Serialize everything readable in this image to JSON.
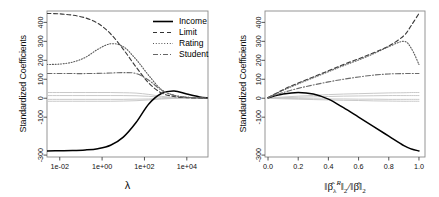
{
  "figure": {
    "title": "",
    "background": "#ffffff",
    "panel_count": 2
  },
  "legend": {
    "position": "top-right of left panel",
    "entries": [
      {
        "label": "Income",
        "style": "solid",
        "color": "#000000"
      },
      {
        "label": "Limit",
        "style": "dashed",
        "color": "#444444"
      },
      {
        "label": "Rating",
        "style": "dotted",
        "color": "#666666"
      },
      {
        "label": "Student",
        "style": "dash-dot",
        "color": "#777777"
      }
    ]
  },
  "chart_data": [
    {
      "type": "line",
      "panel": "left",
      "title": "",
      "xlabel": "λ",
      "ylabel": "Standardized Coefficients",
      "xscale": "log",
      "xlim": [
        0.0025,
        100000
      ],
      "ylim": [
        -310,
        460
      ],
      "xticks": [
        0.01,
        1,
        100,
        10000
      ],
      "xticklabels": [
        "1e-02",
        "1e+00",
        "1e+02",
        "1e+04"
      ],
      "yticks": [
        -300,
        -100,
        0,
        100,
        200,
        300,
        400
      ],
      "yticklabels": [
        "-300",
        "-100",
        "0",
        "100",
        "200",
        "300",
        "400"
      ],
      "grid": false,
      "x": [
        0.0025,
        0.01,
        0.04,
        0.16,
        0.63,
        2.5,
        10,
        40,
        160,
        630,
        2500,
        10000,
        40000,
        100000
      ],
      "series": [
        {
          "name": "Income",
          "style": "solid",
          "values": [
            -278,
            -277,
            -276,
            -273,
            -266,
            -248,
            -205,
            -128,
            -30,
            25,
            38,
            22,
            7,
            2
          ]
        },
        {
          "name": "Limit",
          "style": "dashed",
          "values": [
            447,
            445,
            438,
            424,
            395,
            340,
            258,
            165,
            80,
            28,
            9,
            3,
            1,
            0
          ]
        },
        {
          "name": "Rating",
          "style": "dotted",
          "values": [
            178,
            180,
            190,
            215,
            258,
            287,
            272,
            205,
            120,
            46,
            16,
            5,
            2,
            1
          ]
        },
        {
          "name": "Student",
          "style": "dash-dot",
          "values": [
            130,
            130,
            130,
            130,
            131,
            133,
            135,
            130,
            95,
            42,
            15,
            5,
            2,
            1
          ]
        },
        {
          "name": "other-1",
          "style": "faint",
          "values": [
            30,
            30,
            30,
            30,
            30,
            30,
            29,
            27,
            20,
            10,
            4,
            1,
            0,
            0
          ]
        },
        {
          "name": "other-2",
          "style": "faint",
          "values": [
            14,
            14,
            14,
            14,
            14,
            14,
            14,
            13,
            10,
            5,
            2,
            1,
            0,
            0
          ]
        },
        {
          "name": "other-3",
          "style": "faint",
          "values": [
            -6,
            -6,
            -6,
            -6,
            -6,
            -6,
            -6,
            -5,
            -4,
            -2,
            -1,
            0,
            0,
            0
          ]
        },
        {
          "name": "other-4",
          "style": "faint",
          "values": [
            -16,
            -16,
            -16,
            -16,
            -16,
            -16,
            -15,
            -13,
            -9,
            -4,
            -1,
            0,
            0,
            0
          ]
        }
      ]
    },
    {
      "type": "line",
      "panel": "right",
      "title": "",
      "xlabel": "||β̂λᴿ||₂ / ||β̂||₂",
      "ylabel": "Standardized Coefficients",
      "xscale": "linear",
      "xlim": [
        -0.02,
        1.04
      ],
      "ylim": [
        -310,
        460
      ],
      "xticks": [
        0.0,
        0.2,
        0.4,
        0.6,
        0.8,
        1.0
      ],
      "xticklabels": [
        "0.0",
        "0.2",
        "0.4",
        "0.6",
        "0.8",
        "1.0"
      ],
      "yticks": [
        -300,
        -100,
        0,
        100,
        200,
        300,
        400
      ],
      "yticklabels": [
        "-300",
        "-100",
        "0",
        "100",
        "200",
        "300",
        "400"
      ],
      "grid": false,
      "x": [
        0.0,
        0.1,
        0.2,
        0.3,
        0.4,
        0.5,
        0.6,
        0.7,
        0.8,
        0.9,
        0.95,
        1.0
      ],
      "series": [
        {
          "name": "Income",
          "style": "solid",
          "values": [
            3,
            22,
            30,
            22,
            -5,
            -50,
            -100,
            -150,
            -200,
            -250,
            -268,
            -278
          ]
        },
        {
          "name": "Limit",
          "style": "dashed",
          "values": [
            3,
            45,
            80,
            112,
            145,
            178,
            208,
            240,
            275,
            330,
            385,
            447
          ]
        },
        {
          "name": "Rating",
          "style": "dotted",
          "values": [
            3,
            42,
            76,
            108,
            140,
            172,
            202,
            235,
            272,
            300,
            262,
            178
          ]
        },
        {
          "name": "Student",
          "style": "dash-dot",
          "values": [
            3,
            30,
            52,
            70,
            86,
            100,
            112,
            122,
            128,
            130,
            130,
            130
          ]
        },
        {
          "name": "other-1",
          "style": "faint",
          "values": [
            1,
            6,
            11,
            15,
            19,
            22,
            24,
            26,
            28,
            29,
            30,
            30
          ]
        },
        {
          "name": "other-2",
          "style": "faint",
          "values": [
            1,
            3,
            5,
            7,
            9,
            11,
            12,
            13,
            14,
            14,
            14,
            14
          ]
        },
        {
          "name": "other-3",
          "style": "faint",
          "values": [
            0,
            -1,
            -2,
            -3,
            -4,
            -4,
            -5,
            -5,
            -6,
            -6,
            -6,
            -6
          ]
        },
        {
          "name": "other-4",
          "style": "faint",
          "values": [
            0,
            -3,
            -5,
            -7,
            -9,
            -11,
            -12,
            -14,
            -15,
            -16,
            -16,
            -16
          ]
        }
      ]
    }
  ]
}
